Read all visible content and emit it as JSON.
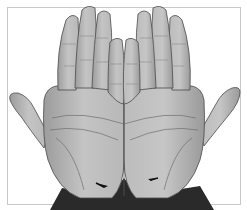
{
  "figure": {
    "background": "#ffffff",
    "frame": {
      "color": "#c8c8c8",
      "x": 7,
      "y": 7,
      "width": 234,
      "height": 198
    },
    "colors": {
      "skin": "#b4b4b4",
      "skin_light": "#cfcfcf",
      "crease": "#6e6e6e",
      "outline": "#4a4a4a",
      "wrist_dark": "#2a2a2a",
      "arrow": "#111111"
    },
    "hands": [
      {
        "name": "left-hand",
        "side": "left"
      },
      {
        "name": "right-hand",
        "side": "right"
      }
    ],
    "arrows": [
      {
        "name": "arrow-left-wrist",
        "x": 104,
        "y": 185,
        "direction": "pointing-right-down"
      },
      {
        "name": "arrow-right-wrist",
        "x": 153,
        "y": 179,
        "direction": "pointing-left"
      }
    ]
  }
}
